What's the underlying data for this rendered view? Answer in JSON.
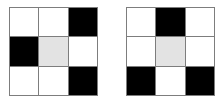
{
  "figure": {
    "type": "two-grid-pattern",
    "background_color": "#ffffff",
    "grid_line_color": "#7d7d7d",
    "palette": {
      "white": "#ffffff",
      "black": "#000000",
      "gray": "#e3e3e3"
    },
    "grids": [
      {
        "name": "left-grid",
        "rows": 3,
        "cols": 3,
        "cells": [
          [
            "white",
            "white",
            "black"
          ],
          [
            "black",
            "gray",
            "white"
          ],
          [
            "white",
            "white",
            "black"
          ]
        ]
      },
      {
        "name": "right-grid",
        "rows": 3,
        "cols": 3,
        "cells": [
          [
            "white",
            "black",
            "white"
          ],
          [
            "white",
            "gray",
            "white"
          ],
          [
            "black",
            "white",
            "black"
          ]
        ]
      }
    ]
  }
}
